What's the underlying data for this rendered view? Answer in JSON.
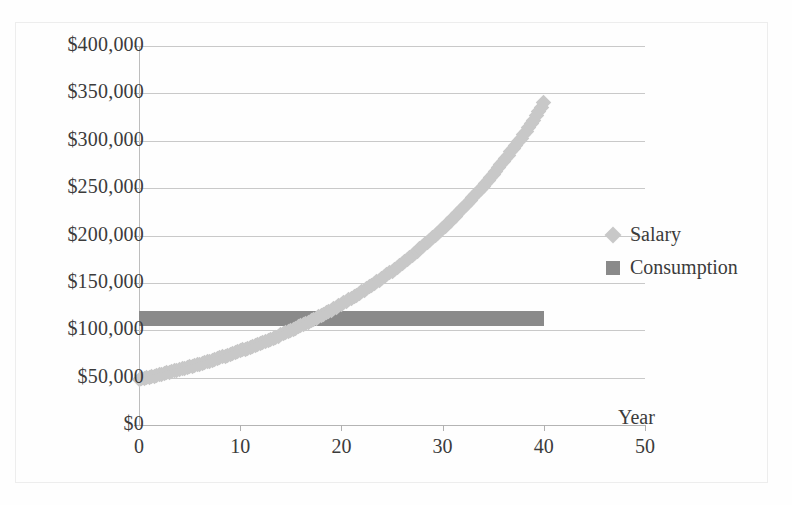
{
  "chart_data": {
    "type": "scatter",
    "title": "",
    "xlabel": "Year",
    "ylabel": "",
    "xlim": [
      0,
      50
    ],
    "ylim": [
      0,
      400000
    ],
    "grid": true,
    "legend_position": "right",
    "x_ticks": [
      "0",
      "10",
      "20",
      "30",
      "40",
      "50"
    ],
    "x_tick_values": [
      0,
      10,
      20,
      30,
      40,
      50
    ],
    "y_ticks": [
      "$0",
      "$50,000",
      "$100,000",
      "$150,000",
      "$200,000",
      "$250,000",
      "$300,000",
      "$350,000",
      "$400,000"
    ],
    "y_tick_values": [
      0,
      50000,
      100000,
      150000,
      200000,
      250000,
      300000,
      350000,
      400000
    ],
    "series": [
      {
        "name": "Salary",
        "type": "scatter",
        "marker": "diamond",
        "color": "#c8c8c8",
        "x": [
          0,
          1,
          2,
          3,
          4,
          5,
          6,
          7,
          8,
          9,
          10,
          11,
          12,
          13,
          14,
          15,
          16,
          17,
          18,
          19,
          20,
          21,
          22,
          23,
          24,
          25,
          26,
          27,
          28,
          29,
          30,
          31,
          32,
          33,
          34,
          35,
          36,
          37,
          38,
          39,
          40
        ],
        "values": [
          48000,
          50400,
          52900,
          55600,
          58400,
          61300,
          64300,
          67500,
          70900,
          74500,
          78200,
          82100,
          86200,
          90500,
          95000,
          99800,
          104800,
          110000,
          115500,
          121300,
          127300,
          133700,
          140400,
          147400,
          154800,
          162500,
          170600,
          179100,
          188100,
          197500,
          207400,
          217700,
          228600,
          240000,
          252000,
          264600,
          277900,
          291800,
          306400,
          321700,
          340000
        ]
      },
      {
        "name": "Consumption",
        "type": "band",
        "marker": "square",
        "color": "#8a8a8a",
        "x_start": 0,
        "x_end": 40,
        "y_low": 105000,
        "y_high": 120000,
        "value": 112500
      }
    ],
    "legend": [
      {
        "label": "Salary",
        "marker": "diamond",
        "color": "#c8c8c8"
      },
      {
        "label": "Consumption",
        "marker": "square",
        "color": "#8a8a8a"
      }
    ]
  },
  "axis": {
    "x_title": "Year"
  },
  "colors": {
    "salary": "#c8c8c8",
    "consumption": "#8a8a8a",
    "gridline": "#c9c9c9",
    "text": "#3b3b3b"
  }
}
